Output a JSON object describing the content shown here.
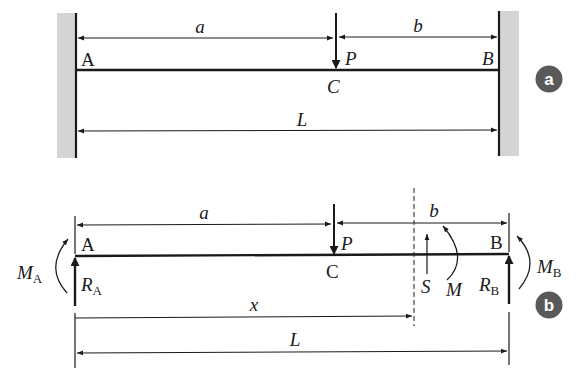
{
  "figure_a": {
    "badge": "a",
    "point_left": "A",
    "point_right": "B",
    "point_load": "C",
    "load": "P",
    "dim_a": "a",
    "dim_b": "b",
    "dim_L": "L"
  },
  "figure_b": {
    "badge": "b",
    "point_left": "A",
    "point_right": "B",
    "point_load": "C",
    "load": "P",
    "dim_a": "a",
    "dim_b": "b",
    "dim_x": "x",
    "dim_L": "L",
    "moment_left": "M",
    "moment_left_sub": "A",
    "reaction_left": "R",
    "reaction_left_sub": "A",
    "moment_right": "M",
    "moment_right_sub": "B",
    "reaction_right": "R",
    "reaction_right_sub": "B",
    "shear": "S",
    "moment_section": "M"
  },
  "colors": {
    "ink": "#1a1a1a",
    "wall": "#d4d4d4",
    "badge": "#595959"
  }
}
